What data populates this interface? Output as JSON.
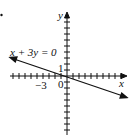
{
  "figure": {
    "bullet": "•",
    "equation_label": "x + 3y = 0",
    "x_axis_label": "x",
    "y_axis_label": "y",
    "tick_label_x": "−3",
    "tick_label_y": "1",
    "origin_label": "0"
  },
  "chart_data": {
    "type": "line",
    "title": "",
    "equation": "x + 3y = 0",
    "xlabel": "x",
    "ylabel": "y",
    "xlim": [
      -9,
      10
    ],
    "ylim": [
      -10,
      10
    ],
    "tick_step": 1,
    "labeled_ticks": {
      "x": [
        -3
      ],
      "y": [
        1
      ]
    },
    "series": [
      {
        "name": "x + 3y = 0",
        "x": [
          -9,
          0,
          10
        ],
        "y": [
          3,
          0,
          -3.33
        ]
      }
    ],
    "arrows": "both ends",
    "color": "#111111"
  }
}
